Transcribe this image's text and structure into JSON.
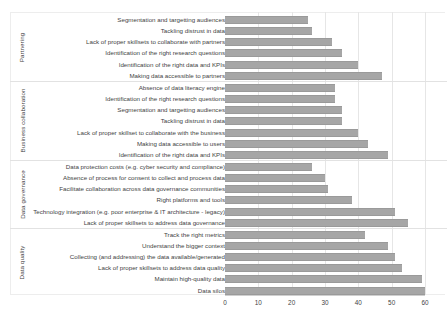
{
  "chart_data": {
    "type": "bar",
    "orientation": "horizontal",
    "title": "",
    "xlabel": "",
    "ylabel": "",
    "xlim": [
      0,
      60
    ],
    "xticks": [
      0,
      10,
      20,
      30,
      40,
      50,
      60
    ],
    "grid": true,
    "legend": "none",
    "bar_color": "#a6a6a6",
    "groups": [
      {
        "name": "Partnering",
        "categories": [
          "Segmentation and targetting audiences",
          "Tackling distrust in data",
          "Lack of proper skillsets to collaborate with partners",
          "Identification of the right research questions",
          "Identification of the right data and KPIs",
          "Making data accessible to partners"
        ],
        "values": [
          25,
          26,
          32,
          35,
          40,
          47
        ]
      },
      {
        "name": "Business collaboration",
        "categories": [
          "Absence of data literacy engine",
          "Identification of the right research questions",
          "Segmentation and targetting audiences",
          "Tackling distrust in data",
          "Lack of proper skillset to collaborate with the business",
          "Making data accessible to users",
          "Identification of the right data and KPIs"
        ],
        "values": [
          33,
          33,
          35,
          35,
          40,
          43,
          49
        ]
      },
      {
        "name": "Data governance",
        "categories": [
          "Data protection costs (e.g. cyber security and compliance)",
          "Absence of process for consent to collect and process data",
          "Facilitate collaboration across data governance communities",
          "Right platforms and tools",
          "Technology integration (e.g. poor enterprise & IT architecture - legacy)",
          "Lack of proper skillsets to address data governance"
        ],
        "values": [
          26,
          30,
          31,
          38,
          51,
          55
        ]
      },
      {
        "name": "Data quality",
        "categories": [
          "Track the right metrics",
          "Understand the bigger context",
          "Collecting (and addressing) the data available/generated",
          "Lack of proper skillsets to address data quality",
          "Maintain high-quality data",
          "Data silos"
        ],
        "values": [
          42,
          49,
          51,
          53,
          59,
          60
        ]
      }
    ]
  }
}
